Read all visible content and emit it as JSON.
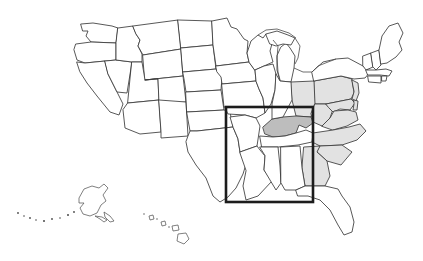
{
  "map": {
    "title": "United States map with regional highlight",
    "projection_note": "continental US with Alaska and Hawaii insets",
    "background_color": "#ffffff",
    "outline_color": "#3a3a3a",
    "highlight_rect": {
      "label": "study-area-highlight",
      "x": 226,
      "y": 107,
      "width": 87,
      "height": 95,
      "stroke_color": "#1c1c1c",
      "stroke_width": 2.6
    },
    "shading_legend": [
      {
        "name": "unshaded",
        "color": "#ffffff",
        "description": "no shading"
      },
      {
        "name": "light",
        "color": "#e2e2e2",
        "description": "light grey band"
      },
      {
        "name": "mid",
        "color": "#d8d8d8",
        "description": "medium grey"
      },
      {
        "name": "dark",
        "color": "#bdbdbd",
        "description": "dark grey emphasis"
      }
    ],
    "insets": [
      {
        "name": "alaska",
        "label": "Alaska"
      },
      {
        "name": "hawaii",
        "label": "Hawaii"
      }
    ],
    "states": [
      {
        "code": "WA",
        "name": "Washington",
        "shade": "unshaded"
      },
      {
        "code": "OR",
        "name": "Oregon",
        "shade": "unshaded"
      },
      {
        "code": "CA",
        "name": "California",
        "shade": "unshaded"
      },
      {
        "code": "NV",
        "name": "Nevada",
        "shade": "unshaded"
      },
      {
        "code": "ID",
        "name": "Idaho",
        "shade": "unshaded"
      },
      {
        "code": "MT",
        "name": "Montana",
        "shade": "unshaded"
      },
      {
        "code": "WY",
        "name": "Wyoming",
        "shade": "unshaded"
      },
      {
        "code": "UT",
        "name": "Utah",
        "shade": "unshaded"
      },
      {
        "code": "AZ",
        "name": "Arizona",
        "shade": "unshaded"
      },
      {
        "code": "NM",
        "name": "New Mexico",
        "shade": "unshaded"
      },
      {
        "code": "CO",
        "name": "Colorado",
        "shade": "unshaded"
      },
      {
        "code": "ND",
        "name": "North Dakota",
        "shade": "unshaded"
      },
      {
        "code": "SD",
        "name": "South Dakota",
        "shade": "unshaded"
      },
      {
        "code": "NE",
        "name": "Nebraska",
        "shade": "unshaded"
      },
      {
        "code": "KS",
        "name": "Kansas",
        "shade": "unshaded"
      },
      {
        "code": "OK",
        "name": "Oklahoma",
        "shade": "unshaded"
      },
      {
        "code": "TX",
        "name": "Texas",
        "shade": "unshaded"
      },
      {
        "code": "MN",
        "name": "Minnesota",
        "shade": "unshaded"
      },
      {
        "code": "IA",
        "name": "Iowa",
        "shade": "unshaded"
      },
      {
        "code": "MO",
        "name": "Missouri",
        "shade": "unshaded"
      },
      {
        "code": "AR",
        "name": "Arkansas",
        "shade": "unshaded"
      },
      {
        "code": "LA",
        "name": "Louisiana",
        "shade": "unshaded"
      },
      {
        "code": "WI",
        "name": "Wisconsin",
        "shade": "unshaded"
      },
      {
        "code": "IL",
        "name": "Illinois",
        "shade": "unshaded"
      },
      {
        "code": "MI",
        "name": "Michigan",
        "shade": "unshaded"
      },
      {
        "code": "IN",
        "name": "Indiana",
        "shade": "unshaded"
      },
      {
        "code": "OH",
        "name": "Ohio",
        "shade": "light"
      },
      {
        "code": "KY",
        "name": "Kentucky",
        "shade": "dark"
      },
      {
        "code": "TN",
        "name": "Tennessee",
        "shade": "unshaded"
      },
      {
        "code": "MS",
        "name": "Mississippi",
        "shade": "unshaded"
      },
      {
        "code": "AL",
        "name": "Alabama",
        "shade": "unshaded"
      },
      {
        "code": "GA",
        "name": "Georgia",
        "shade": "light"
      },
      {
        "code": "FL",
        "name": "Florida",
        "shade": "unshaded"
      },
      {
        "code": "SC",
        "name": "South Carolina",
        "shade": "light"
      },
      {
        "code": "NC",
        "name": "North Carolina",
        "shade": "light"
      },
      {
        "code": "VA",
        "name": "Virginia",
        "shade": "light"
      },
      {
        "code": "WV",
        "name": "West Virginia",
        "shade": "light"
      },
      {
        "code": "MD",
        "name": "Maryland",
        "shade": "light"
      },
      {
        "code": "DE",
        "name": "Delaware",
        "shade": "light"
      },
      {
        "code": "PA",
        "name": "Pennsylvania",
        "shade": "light"
      },
      {
        "code": "NJ",
        "name": "New Jersey",
        "shade": "light"
      },
      {
        "code": "NY",
        "name": "New York",
        "shade": "unshaded"
      },
      {
        "code": "CT",
        "name": "Connecticut",
        "shade": "unshaded"
      },
      {
        "code": "RI",
        "name": "Rhode Island",
        "shade": "unshaded"
      },
      {
        "code": "MA",
        "name": "Massachusetts",
        "shade": "unshaded"
      },
      {
        "code": "VT",
        "name": "Vermont",
        "shade": "unshaded"
      },
      {
        "code": "NH",
        "name": "New Hampshire",
        "shade": "unshaded"
      },
      {
        "code": "ME",
        "name": "Maine",
        "shade": "unshaded"
      },
      {
        "code": "AK",
        "name": "Alaska",
        "shade": "unshaded"
      },
      {
        "code": "HI",
        "name": "Hawaii",
        "shade": "unshaded"
      }
    ]
  }
}
